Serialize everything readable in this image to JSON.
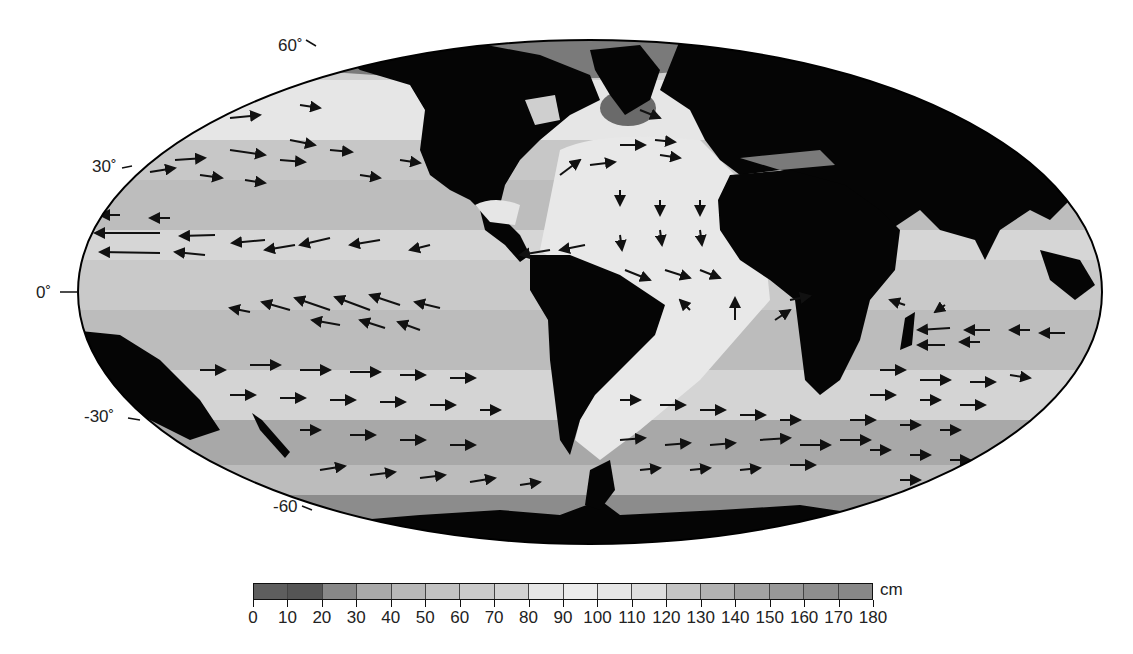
{
  "map": {
    "projection": "Mollweide (global)",
    "ellipse": {
      "cx": 590,
      "cy": 292,
      "rx": 512,
      "ry": 252
    },
    "colors": {
      "land": "#050505",
      "ice": "#7a7a7a",
      "ocean_base": "#cfcfcf",
      "outline": "#000000",
      "arrow": "#111111"
    },
    "latitude_labels": [
      {
        "text": "60˚",
        "x": 278,
        "y": 36
      },
      {
        "text": "30˚",
        "x": 92,
        "y": 157
      },
      {
        "text": "0˚",
        "x": 36,
        "y": 283
      },
      {
        "text": "-30˚",
        "x": 84,
        "y": 407
      },
      {
        "text": "-60",
        "x": 273,
        "y": 497
      }
    ]
  },
  "colorbar": {
    "unit": "cm",
    "tick_labels": [
      "0",
      "10",
      "20",
      "30",
      "40",
      "50",
      "60",
      "70",
      "80",
      "90",
      "100",
      "110",
      "120",
      "130",
      "140",
      "150",
      "160",
      "170",
      "180"
    ],
    "colors": [
      "#5e5e5e",
      "#555555",
      "#888888",
      "#a9a9a9",
      "#b8b8b8",
      "#c2c2c2",
      "#cacaca",
      "#d2d2d2",
      "#e6e6e6",
      "#ececec",
      "#e6e6e6",
      "#dedede",
      "#c4c4c4",
      "#b2b2b2",
      "#a2a2a2",
      "#989898",
      "#8e8e8e",
      "#888888"
    ]
  },
  "chart_data": {
    "type": "heatmap",
    "title": "",
    "colorbar_label": "cm",
    "colorbar_range": [
      0,
      180
    ],
    "colorbar_step": 10,
    "latitude_ticks": [
      "60°",
      "30°",
      "0°",
      "-30°",
      "-60"
    ],
    "vector_patterns": [
      {
        "region": "North Pacific 30-45N",
        "direction": "eastward (westerlies)"
      },
      {
        "region": "Tropical Pacific 5-20N",
        "direction": "westward"
      },
      {
        "region": "Equatorial/South Pacific 0-15S",
        "direction": "westward / north-westward"
      },
      {
        "region": "South Pacific 25-45S",
        "direction": "eastward"
      },
      {
        "region": "North Atlantic 35-50N",
        "direction": "north-eastward"
      },
      {
        "region": "Tropical Atlantic",
        "direction": "southward then south-eastward"
      },
      {
        "region": "South Atlantic 30-55S",
        "direction": "eastward"
      },
      {
        "region": "Indian Ocean 10-20S",
        "direction": "westward"
      },
      {
        "region": "Southern Indian Ocean 30-55S",
        "direction": "eastward"
      }
    ]
  }
}
